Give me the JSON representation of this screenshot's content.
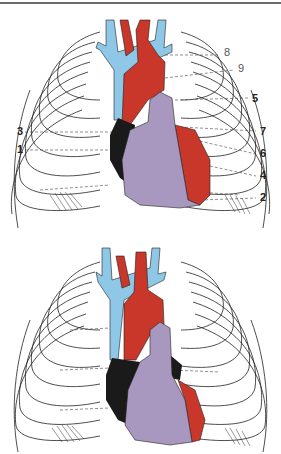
{
  "figure": {
    "panels": [
      {
        "id": "top",
        "labeled": true,
        "labels": [
          {
            "text": "8",
            "x": 224,
            "y": 51,
            "weight": "light"
          },
          {
            "text": "9",
            "x": 238,
            "y": 67,
            "weight": "light"
          },
          {
            "text": "5",
            "x": 252,
            "y": 95,
            "weight": "bold"
          },
          {
            "text": "3",
            "x": 17,
            "y": 128,
            "weight": "bold"
          },
          {
            "text": "7",
            "x": 260,
            "y": 128,
            "weight": "bold"
          },
          {
            "text": "1",
            "x": 17,
            "y": 146,
            "weight": "bold"
          },
          {
            "text": "6",
            "x": 260,
            "y": 150,
            "weight": "bold"
          },
          {
            "text": "4",
            "x": 260,
            "y": 172,
            "weight": "bold"
          },
          {
            "text": "2",
            "x": 260,
            "y": 194,
            "weight": "bold"
          }
        ]
      },
      {
        "id": "bottom",
        "labeled": false,
        "labels": []
      }
    ],
    "colors": {
      "vein_blue": "#8ec8e6",
      "artery_red": "#c8372a",
      "ventricle_purple": "#a898c0",
      "atrium_black": "#1a1a1a",
      "outline": "#222222"
    }
  }
}
